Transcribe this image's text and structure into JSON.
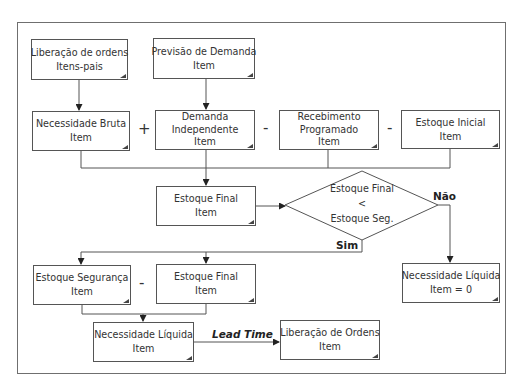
{
  "diagram": {
    "boxes": {
      "liberacao_itens_pais": {
        "line1": "Liberação de ordens",
        "line2": "Itens-pais"
      },
      "previsao_demanda": {
        "line1": "Previsão de Demanda",
        "line2": "Item"
      },
      "necessidade_bruta": {
        "line1": "Necessidade Bruta",
        "line2": "Item"
      },
      "demanda_independente": {
        "line1": "Demanda",
        "line2": "Independente",
        "line3": "Item"
      },
      "recebimento_programado": {
        "line1": "Recebimento",
        "line2": "Programado",
        "line3": "Item"
      },
      "estoque_inicial": {
        "line1": "Estoque Inicial",
        "line2": "Item"
      },
      "estoque_final": {
        "line1": "Estoque Final",
        "line2": "Item"
      },
      "estoque_seguranca": {
        "line1": "Estoque Segurança",
        "line2": "Item"
      },
      "estoque_final_2": {
        "line1": "Estoque Final",
        "line2": "Item"
      },
      "necessidade_liquida": {
        "line1": "Necessidade Líquida",
        "line2": "Item"
      },
      "liberacao_ordens": {
        "line1": "Liberação de Ordens",
        "line2": "Item"
      },
      "necessidade_liquida_zero": {
        "line1": "Necessidade Líquida",
        "line2": "Item = 0"
      }
    },
    "decision": {
      "line1": "Estoque Final",
      "line2": "<",
      "line3": "Estoque Seg."
    },
    "operators": {
      "plus": "+",
      "minus1": "-",
      "minus2": "-",
      "minus3": "-"
    },
    "branch_labels": {
      "yes": "Sim",
      "no": "Não"
    },
    "edge_labels": {
      "lead_time": "Lead Time"
    },
    "colors": {
      "line": "#555555",
      "frame": "#6f6f6f",
      "text": "#333333",
      "background": "#ffffff"
    }
  }
}
